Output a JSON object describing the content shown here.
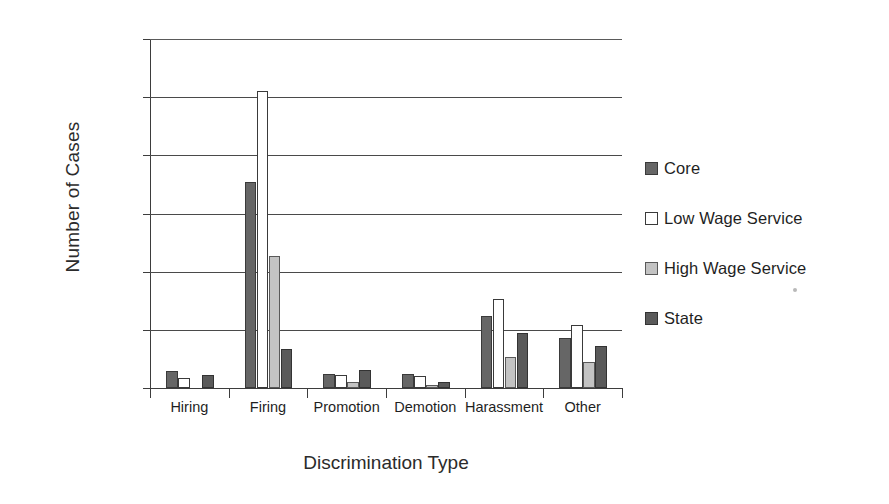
{
  "chart_data": {
    "type": "bar",
    "title": "",
    "xlabel": "Discrimination Type",
    "ylabel": "Number of Cases",
    "ylim": [
      0,
      1200
    ],
    "yticks": [
      0,
      200,
      400,
      600,
      800,
      1000,
      1200
    ],
    "grid": true,
    "legend_position": "right",
    "categories": [
      "Hiring",
      "Firing",
      "Promotion",
      "Demotion",
      "Harassment",
      "Other"
    ],
    "series": [
      {
        "name": "Core",
        "color": "#666666",
        "values": [
          60,
          710,
          48,
          48,
          248,
          172
        ]
      },
      {
        "name": "Low Wage Service",
        "color": "#ffffff",
        "values": [
          35,
          1020,
          45,
          42,
          305,
          215
        ]
      },
      {
        "name": "High Wage Service",
        "color": "#c3c3c3",
        "values": [
          0,
          455,
          20,
          12,
          105,
          90
        ]
      },
      {
        "name": "State",
        "color": "#5a5a5a",
        "values": [
          45,
          135,
          62,
          20,
          190,
          145
        ]
      }
    ]
  },
  "axes": {
    "y_title": "Number of Cases",
    "x_title": "Discrimination Type",
    "y_tick_labels": [
      "1200",
      "1000",
      "800",
      "600",
      "400",
      "200",
      "0"
    ],
    "x_tick_labels": [
      "Hiring",
      "Firing",
      "Promotion",
      "Demotion",
      "Harassment",
      "Other"
    ]
  },
  "legend": {
    "items": [
      {
        "label": "Core",
        "swatch": "core"
      },
      {
        "label": "Low Wage Service",
        "swatch": "low"
      },
      {
        "label": "High Wage Service",
        "swatch": "high"
      },
      {
        "label": "State",
        "swatch": "state"
      }
    ]
  }
}
